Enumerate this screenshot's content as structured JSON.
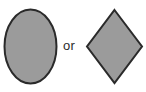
{
  "figure": {
    "background_color": "#ffffff",
    "canvas": {
      "width": 146,
      "height": 92
    },
    "conjunction": {
      "text": "or",
      "color": "#2b2b2b",
      "font_size_px": 13
    },
    "shapes": [
      {
        "id": "ellipse",
        "name": "ellipse",
        "label": "Ellipse",
        "fill_color": "#9b9b9b",
        "stroke_color": "#2a2a2a",
        "stroke_width": 2,
        "geometry": {
          "center_x": 30.5,
          "center_y": 46.5,
          "radius_x": 26,
          "radius_y": 37
        }
      },
      {
        "id": "diamond",
        "name": "diamond",
        "label": "Diamond",
        "fill_color": "#9b9b9b",
        "stroke_color": "#2a2a2a",
        "stroke_width": 2,
        "geometry": {
          "points": "114.5,10 142,46.5 114.5,83 87,46.5",
          "top_x": 114.5,
          "top_y": 10,
          "right_x": 142,
          "right_y": 46.5,
          "bottom_x": 114.5,
          "bottom_y": 83,
          "left_x": 87,
          "left_y": 46.5
        }
      }
    ]
  }
}
